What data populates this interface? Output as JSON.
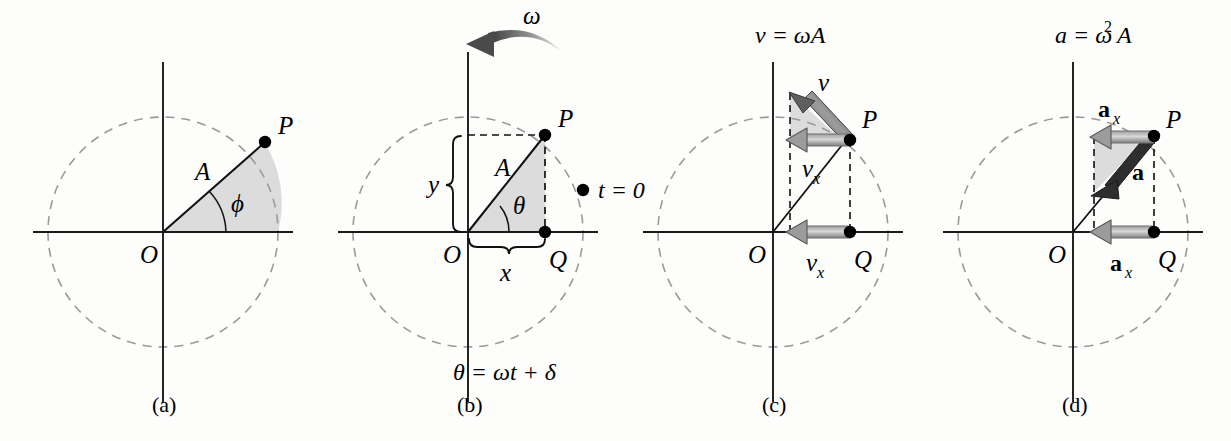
{
  "figure": {
    "background_color": "#fdfdfc",
    "ink_color": "#000000",
    "dashed_circle_color": "#9a9a9a",
    "shade_fill_color": "#dcdcdc",
    "arrow_gray": "#8c8c8c",
    "arrow_dark": "#555555",
    "panel_count": 4
  },
  "panels": [
    {
      "id": "a",
      "caption": "(a)",
      "top_equation": "",
      "origin_label": "O",
      "point_labels": {
        "p": "P"
      },
      "radius_label": "A",
      "angle_label": "ϕ",
      "has_shaded_sector": true,
      "has_dashed_circle": true
    },
    {
      "id": "b",
      "caption": "(b)",
      "top_equation": "",
      "omega_label": "ω",
      "origin_label": "O",
      "point_labels": {
        "p": "P",
        "q": "Q"
      },
      "radius_label": "A",
      "angle_label": "θ",
      "brace_x_label": "x",
      "brace_y_label": "y",
      "t_zero_label": "t = 0",
      "bottom_equation": "θ = ωt + δ",
      "has_shaded_triangle": true,
      "has_dashed_circle": true
    },
    {
      "id": "c",
      "caption": "(c)",
      "top_equation": "v = ωA",
      "origin_label": "O",
      "point_labels": {
        "p": "P",
        "q": "Q"
      },
      "vector_labels": {
        "v": "v",
        "vx_upper": "v",
        "vx_upper_sub": "x",
        "vx_lower": "v",
        "vx_lower_sub": "x"
      },
      "has_shaded_triangle": true,
      "has_dashed_circle": true
    },
    {
      "id": "d",
      "caption": "(d)",
      "top_equation": "a = ω² A",
      "top_equation_base": "a = ω",
      "top_equation_exp": "2",
      "top_equation_tail": "A",
      "origin_label": "O",
      "point_labels": {
        "p": "P",
        "q": "Q"
      },
      "vector_labels": {
        "a": "a",
        "ax_upper": "a",
        "ax_upper_sub": "x",
        "ax_lower": "a",
        "ax_lower_sub": "x"
      },
      "has_shaded_triangle": true,
      "has_dashed_circle": true
    }
  ],
  "geometry": {
    "note": "approximate pixel positions of drawn features",
    "panel_a": {
      "cx": 163,
      "cy": 232,
      "r": 115,
      "px": 265,
      "py": 142
    },
    "panel_b": {
      "cx": 468,
      "cy": 232,
      "r": 115,
      "px": 545,
      "py": 135,
      "qx": 545,
      "qy": 232
    },
    "panel_c": {
      "cx": 773,
      "cy": 232,
      "r": 115,
      "px": 850,
      "py": 135,
      "qx": 850,
      "qy": 232
    },
    "panel_d": {
      "cx": 1073,
      "cy": 232,
      "r": 115,
      "px": 1154,
      "py": 135,
      "qx": 1154,
      "qy": 232
    }
  }
}
